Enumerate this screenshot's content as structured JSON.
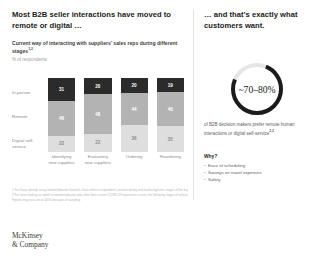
{
  "left": {
    "headline": "Most B2B seller interactions have moved to remote or digital …",
    "subtitle": "Current way of interacting with suppliers’ sales reps during different stages",
    "subtitle_sup": "1,2",
    "units": "% of respondents"
  },
  "chart_data": {
    "type": "bar",
    "title": "Current way of interacting with suppliers’ sales reps during different stages",
    "xlabel": "",
    "ylabel": "% of respondents",
    "ylim": [
      0,
      100
    ],
    "grid": false,
    "stacked": true,
    "legend": "row-labels-left",
    "categories": [
      "Identifying new suppliers",
      "Evaluating new suppliers",
      "Ordering",
      "Reordering"
    ],
    "row_labels": [
      "In-person",
      "Remote",
      "Digital self-service"
    ],
    "series": [
      {
        "name": "In-person",
        "color": "#2b2b2b",
        "values": [
          31,
          20,
          20,
          19
        ]
      },
      {
        "name": "Remote",
        "color": "#b3b3b3",
        "values": [
          46,
          48,
          44,
          46
        ]
      },
      {
        "name": "Digital self-service",
        "color": "#dedede",
        "values": [
          22,
          22,
          36,
          35
        ]
      }
    ]
  },
  "footnotes": {
    "line1": "1 For those already using remote/inbound channels. Data reflects respondents’ position during real marketing/sales stages of the buying cycle.",
    "line2": "2 For those looking to switch to remote/inbound sales after their current COVID-19 experience is over; the following stages of selection and research.",
    "line3": "Figures may not sum to 100% because of rounding."
  },
  "logo": {
    "line1": "McKinsey",
    "line2": "& Company"
  },
  "right": {
    "headline": "… and that’s exactly what customers want.",
    "donut_value": "~70–80%",
    "donut_percent_start": 70,
    "donut_percent_end": 80,
    "stat_caption": "of B2B decision makers prefer remote human interactions or digital self-service",
    "stat_caption_sup": "2,3",
    "why_title": "Why?",
    "why_items": [
      "Ease of scheduling",
      "Savings on travel expenses",
      "Safety"
    ]
  }
}
